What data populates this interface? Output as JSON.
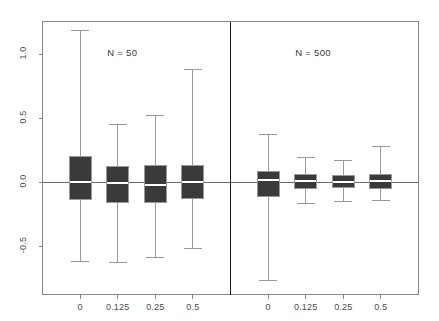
{
  "figure": {
    "width": 439,
    "height": 321,
    "background": "#ffffff",
    "frame_color": "#888888",
    "box_fill": "#3a3a3a",
    "whisker_color": "#999999",
    "median_color": "#ffffff",
    "zero_line_color": "#666666",
    "divider_color": "#1a1a1a"
  },
  "chart_data": {
    "type": "box",
    "title": "",
    "xlabel": "",
    "ylabel": "",
    "ylim": [
      -0.78,
      1.28
    ],
    "yticks": [
      -0.5,
      0.0,
      0.5,
      1.0
    ],
    "ytick_labels": [
      "-0.5",
      "0.0",
      "0.5",
      "1.0"
    ],
    "grid": false,
    "legend": "none",
    "reference_line_y": 0.0,
    "panels": [
      {
        "label": "N = 50",
        "categories": [
          "0",
          "0.125",
          "0.25",
          "0.5"
        ],
        "boxes": [
          {
            "category": "0",
            "whisker_low": -0.62,
            "q1": -0.14,
            "median": 0.0,
            "q3": 0.2,
            "whisker_high": 1.18
          },
          {
            "category": "0.125",
            "whisker_low": -0.63,
            "q1": -0.16,
            "median": -0.01,
            "q3": 0.125,
            "whisker_high": 0.45
          },
          {
            "category": "0.25",
            "whisker_low": -0.59,
            "q1": -0.16,
            "median": -0.02,
            "q3": 0.13,
            "whisker_high": 0.52
          },
          {
            "category": "0.5",
            "whisker_low": -0.52,
            "q1": -0.125,
            "median": 0.0,
            "q3": 0.13,
            "whisker_high": 0.88
          }
        ]
      },
      {
        "label": "N = 500",
        "categories": [
          "0",
          "0.125",
          "0.25",
          "0.5"
        ],
        "boxes": [
          {
            "category": "0",
            "whisker_low": -0.77,
            "q1": -0.11,
            "median": 0.015,
            "q3": 0.08,
            "whisker_high": 0.375
          },
          {
            "category": "0.125",
            "whisker_low": -0.165,
            "q1": -0.05,
            "median": 0.005,
            "q3": 0.055,
            "whisker_high": 0.195
          },
          {
            "category": "0.25",
            "whisker_low": -0.15,
            "q1": -0.045,
            "median": 0.0,
            "q3": 0.05,
            "whisker_high": 0.17
          },
          {
            "category": "0.5",
            "whisker_low": -0.145,
            "q1": -0.05,
            "median": 0.005,
            "q3": 0.055,
            "whisker_high": 0.275
          }
        ]
      }
    ]
  }
}
